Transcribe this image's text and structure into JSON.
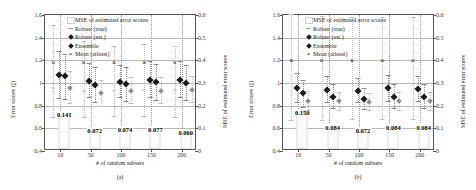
{
  "figure": {
    "panels": [
      {
        "caption": "(a)",
        "xlabel": "# of random subsets",
        "ylabel_left": "Error scores (ξ)",
        "ylabel_right": "MSE of estimated error scores",
        "categories": [
          "10",
          "50",
          "100",
          "150",
          "200"
        ],
        "mse_values": [
          "0.141",
          "0.072",
          "0.074",
          "0.077",
          "0.060"
        ],
        "mse_numeric": [
          0.141,
          0.072,
          0.074,
          0.077,
          0.06
        ],
        "series": [
          {
            "name": "Robust (true)",
            "values": [
              0.96,
              0.93,
              0.93,
              0.94,
              0.94
            ],
            "lo": [
              0.7,
              0.7,
              0.71,
              0.71,
              0.7
            ],
            "hi": [
              1.51,
              1.37,
              1.33,
              1.34,
              1.33
            ]
          },
          {
            "name": "Robust (est.)",
            "values": [
              1.07,
              1.02,
              1.01,
              1.03,
              1.03
            ],
            "lo": [
              0.87,
              0.88,
              0.88,
              0.88,
              0.88
            ],
            "hi": [
              1.28,
              1.18,
              1.16,
              1.19,
              1.19
            ]
          },
          {
            "name": "Ensemble",
            "values": [
              1.06,
              0.98,
              0.99,
              1.01,
              1.0
            ],
            "lo": [
              0.86,
              0.83,
              0.84,
              0.85,
              0.85
            ],
            "hi": [
              1.26,
              1.14,
              1.14,
              1.17,
              1.16
            ]
          },
          {
            "name": "Mean (atleast)",
            "values": [
              0.96,
              0.91,
              0.93,
              0.93,
              0.94
            ],
            "lo": [
              0.82,
              0.8,
              0.82,
              0.82,
              0.83
            ],
            "hi": [
              1.11,
              1.03,
              1.05,
              1.05,
              1.06
            ]
          }
        ]
      },
      {
        "caption": "(b)",
        "xlabel": "# of random subsets",
        "ylabel_left": "Error scores (ξ)",
        "ylabel_right": "MSE of estimated error scores",
        "categories": [
          "10",
          "50",
          "100",
          "150",
          "200"
        ],
        "mse_values": [
          "0.150",
          "0.084",
          "0.072",
          "0.084",
          "0.084"
        ],
        "mse_numeric": [
          0.15,
          0.084,
          0.072,
          0.084,
          0.084
        ],
        "series": [
          {
            "name": "Robust (true)",
            "values": [
              1.2,
              1.2,
              1.2,
              1.2,
              1.2
            ],
            "lo": [
              0.67,
              0.67,
              0.68,
              0.68,
              0.68
            ],
            "hi": [
              1.61,
              1.59,
              1.58,
              1.58,
              1.58
            ]
          },
          {
            "name": "Robust (est.)",
            "values": [
              0.96,
              0.94,
              0.93,
              0.96,
              0.95
            ],
            "lo": [
              0.83,
              0.83,
              0.83,
              0.84,
              0.84
            ],
            "hi": [
              1.09,
              1.06,
              1.04,
              1.07,
              1.06
            ]
          },
          {
            "name": "Ensemble",
            "values": [
              0.91,
              0.88,
              0.86,
              0.88,
              0.88
            ],
            "lo": [
              0.79,
              0.78,
              0.77,
              0.78,
              0.78
            ],
            "hi": [
              1.03,
              0.99,
              0.96,
              0.99,
              0.99
            ]
          },
          {
            "name": "Mean (atleast)",
            "values": [
              0.84,
              0.84,
              0.83,
              0.84,
              0.84
            ],
            "lo": [
              0.76,
              0.76,
              0.76,
              0.76,
              0.76
            ],
            "hi": [
              0.93,
              0.92,
              0.91,
              0.92,
              0.92
            ]
          }
        ]
      }
    ],
    "legend": {
      "items": [
        {
          "label": "MSE of estimated error scores",
          "symbol": "bar-swatch"
        },
        {
          "label": "Robust (true)",
          "symbol": "tick-marker"
        },
        {
          "label": "Robust (est.)",
          "symbol": "diamond-marker"
        },
        {
          "label": "Ensemble",
          "symbol": "diamond-marker"
        },
        {
          "label": "Mean (atleast)",
          "symbol": "x-marker"
        }
      ]
    },
    "axes": {
      "left_ticks": [
        "1.6",
        "1.4",
        "1.2",
        "1",
        "0.8",
        "0.6",
        "0.4"
      ],
      "left_range": [
        0.4,
        1.6
      ],
      "right_ticks": [
        "0.6",
        "0.5",
        "0.4",
        "0.3",
        "0.2",
        "0.1",
        "0"
      ],
      "right_range": [
        0.0,
        0.6
      ]
    }
  },
  "chart_data": {
    "type": "scatter",
    "title": "",
    "subplots": [
      {
        "id": "a",
        "xlabel": "# of random subsets",
        "ylabel": "Error scores (ξ)",
        "ylabel_secondary": "MSE of estimated error scores",
        "categories": [
          "10",
          "50",
          "100",
          "150",
          "200"
        ],
        "ylim": [
          0.4,
          1.6
        ],
        "ylim_secondary": [
          0.0,
          0.6
        ],
        "grid": true,
        "legend_position": "top-center",
        "series": [
          {
            "name": "Robust (true)",
            "values": [
              0.96,
              0.93,
              0.93,
              0.94,
              0.94
            ]
          },
          {
            "name": "Robust (est.)",
            "values": [
              1.07,
              1.02,
              1.01,
              1.03,
              1.03
            ]
          },
          {
            "name": "Ensemble",
            "values": [
              1.06,
              0.98,
              0.99,
              1.01,
              1.0
            ]
          },
          {
            "name": "Mean (atleast)",
            "values": [
              0.96,
              0.91,
              0.93,
              0.93,
              0.94
            ]
          },
          {
            "name": "MSE of estimated error scores",
            "values": [
              0.141,
              0.072,
              0.074,
              0.077,
              0.06
            ],
            "axis": "secondary"
          }
        ]
      },
      {
        "id": "b",
        "xlabel": "# of random subsets",
        "ylabel": "Error scores (ξ)",
        "ylabel_secondary": "MSE of estimated error scores",
        "categories": [
          "10",
          "50",
          "100",
          "150",
          "200"
        ],
        "ylim": [
          0.4,
          1.6
        ],
        "ylim_secondary": [
          0.0,
          0.6
        ],
        "grid": true,
        "legend_position": "top-center",
        "series": [
          {
            "name": "Robust (true)",
            "values": [
              1.2,
              1.2,
              1.2,
              1.2,
              1.2
            ]
          },
          {
            "name": "Robust (est.)",
            "values": [
              0.96,
              0.94,
              0.93,
              0.96,
              0.95
            ]
          },
          {
            "name": "Ensemble",
            "values": [
              0.91,
              0.88,
              0.86,
              0.88,
              0.88
            ]
          },
          {
            "name": "Mean (atleast)",
            "values": [
              0.84,
              0.84,
              0.83,
              0.84,
              0.84
            ]
          },
          {
            "name": "MSE of estimated error scores",
            "values": [
              0.15,
              0.084,
              0.072,
              0.084,
              0.084
            ],
            "axis": "secondary"
          }
        ]
      }
    ]
  }
}
